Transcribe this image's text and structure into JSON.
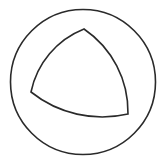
{
  "diagram": {
    "background": "#ffffff",
    "stroke_color": "#2a2a2a",
    "stroke_width": 1.6,
    "shapes": [
      {
        "type": "circle",
        "name": "outer-circle",
        "cx": 83,
        "cy": 82,
        "r": 72.5
      },
      {
        "type": "curved-triangle",
        "name": "inner-curved-triangle",
        "vertices": [
          [
            84,
            29
          ],
          [
            31,
            92
          ],
          [
            128,
            114
          ]
        ],
        "description": "Reuleaux-like triangle with outward-bulging arcs inscribed within the circle"
      }
    ]
  }
}
